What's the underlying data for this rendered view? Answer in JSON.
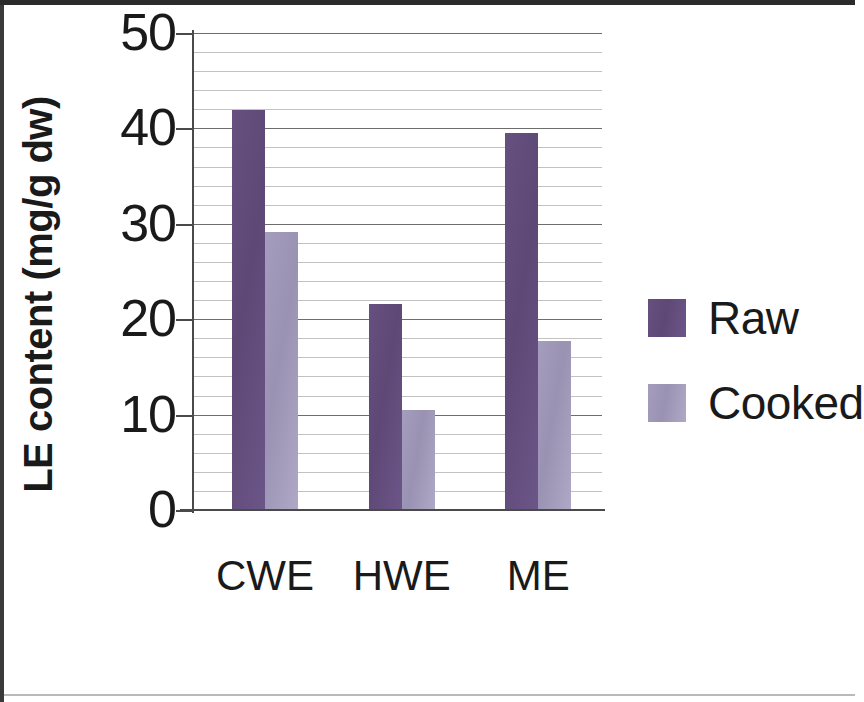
{
  "chart_data": {
    "type": "bar",
    "title": "",
    "xlabel": "EXTRACTS",
    "ylabel": "LE content (mg/g dw)",
    "categories": [
      "CWE",
      "HWE",
      "ME"
    ],
    "series": [
      {
        "name": "Raw",
        "color": "#5d4876",
        "values": [
          41.9,
          21.6,
          39.5
        ]
      },
      {
        "name": "Cooked",
        "color": "#9992b2",
        "values": [
          29.1,
          10.5,
          17.7
        ]
      }
    ],
    "ylim": [
      0,
      50
    ],
    "y_major_ticks": [
      0,
      10,
      20,
      30,
      40,
      50
    ],
    "y_tick_labels": [
      "0",
      "10",
      "20",
      "30",
      "40",
      "50"
    ],
    "y_minor_tick_step": 2,
    "grid": "horizontal",
    "legend_position": "right",
    "legend_entries": [
      "Raw",
      "Cooked"
    ]
  },
  "axes": {
    "y_title": "LE content (mg/g dw)",
    "x_title": "EXTRACTS"
  },
  "legend": {
    "entries": [
      {
        "label": "Raw",
        "swatch": "raw-swatch"
      },
      {
        "label": "Cooked",
        "swatch": "cooked-swatch"
      }
    ]
  }
}
